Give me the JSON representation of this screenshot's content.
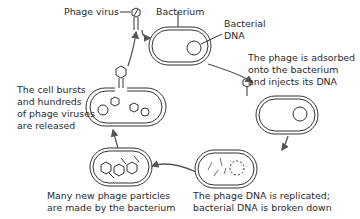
{
  "diagram": {
    "labels": {
      "phage_virus": "Phage virus",
      "bacterium": "Bacterium",
      "bacterial_dna_1": "Bacterial",
      "bacterial_dna_2": "DNA",
      "step1_l1": "The phage is adsorbed",
      "step1_l2": "onto the bacterium",
      "step1_l3": "and injects its DNA",
      "step2_l1": "The phage DNA is replicated;",
      "step2_l2": "bacterial DNA is broken down",
      "step3_l1": "Many new phage particles",
      "step3_l2": "are made by the bacterium",
      "step4_l1": "The cell bursts",
      "step4_l2": "and hundreds",
      "step4_l3": "of phage viruses",
      "step4_l4": "are released"
    },
    "colors": {
      "line": "#333333",
      "arrow": "#555555",
      "background": "#ffffff"
    }
  }
}
